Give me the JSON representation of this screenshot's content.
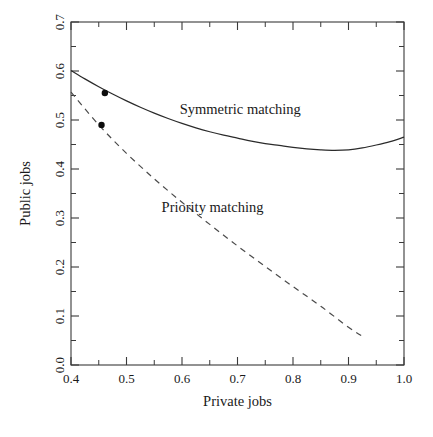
{
  "figure": {
    "background": "#ffffff",
    "frame_color": "#3a3a3a"
  },
  "chart_data": {
    "type": "line",
    "title": "",
    "subtitle": "",
    "xlabel": "Private jobs",
    "ylabel": "Public jobs",
    "xlim": [
      0.4,
      1.0
    ],
    "ylim": [
      0.0,
      0.7
    ],
    "grid": false,
    "legend_position": "inline-annotation",
    "xticks": [
      0.4,
      0.5,
      0.6,
      0.7,
      0.8,
      0.9,
      1.0
    ],
    "xtick_labels": [
      "0.4",
      "0.5",
      "0.6",
      "0.7",
      "0.8",
      "0.9",
      "1.0"
    ],
    "xminor_ticks": [
      0.45,
      0.55,
      0.65,
      0.75,
      0.85,
      0.95
    ],
    "yticks": [
      0.0,
      0.1,
      0.2,
      0.3,
      0.4,
      0.5,
      0.6,
      0.7
    ],
    "ytick_labels": [
      "0.0",
      "0.1",
      "0.2",
      "0.3",
      "0.4",
      "0.5",
      "0.6",
      "0.7"
    ],
    "yminor_ticks": [
      0.05,
      0.15,
      0.25,
      0.35,
      0.45,
      0.55,
      0.65
    ],
    "series": [
      {
        "name": "Symmetric matching",
        "style": "solid",
        "color": "#2b2b2b",
        "label_x": 0.705,
        "label_y": 0.513,
        "x": [
          0.4,
          0.425,
          0.45,
          0.475,
          0.5,
          0.525,
          0.55,
          0.575,
          0.6,
          0.625,
          0.65,
          0.675,
          0.7,
          0.725,
          0.75,
          0.775,
          0.8,
          0.825,
          0.85,
          0.875,
          0.9,
          0.925,
          0.95,
          0.975,
          1.0
        ],
        "y": [
          0.601,
          0.584,
          0.568,
          0.553,
          0.539,
          0.526,
          0.514,
          0.503,
          0.493,
          0.484,
          0.476,
          0.469,
          0.463,
          0.457,
          0.452,
          0.448,
          0.444,
          0.441,
          0.439,
          0.438,
          0.439,
          0.443,
          0.449,
          0.456,
          0.465
        ]
      },
      {
        "name": "Priority matching",
        "style": "dashed",
        "color": "#4a4a4a",
        "label_x": 0.655,
        "label_y": 0.312,
        "x": [
          0.4,
          0.45,
          0.5,
          0.55,
          0.6,
          0.65,
          0.7,
          0.75,
          0.8,
          0.85,
          0.9,
          0.93
        ],
        "y": [
          0.557,
          0.49,
          0.432,
          0.38,
          0.332,
          0.287,
          0.243,
          0.201,
          0.16,
          0.12,
          0.077,
          0.055
        ]
      }
    ],
    "markers": [
      {
        "name": "symmetric-equilibrium-point",
        "series": "Symmetric matching",
        "x": 0.461,
        "y": 0.555
      },
      {
        "name": "priority-equilibrium-point",
        "series": "Priority matching",
        "x": 0.455,
        "y": 0.49
      }
    ]
  }
}
